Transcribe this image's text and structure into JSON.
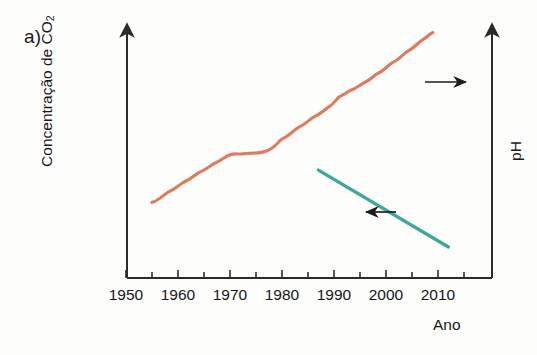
{
  "panel": {
    "label": "a)"
  },
  "axes": {
    "y_left_title_main": "Concentração de CO",
    "y_left_title_sub": "2",
    "y_right_title": "pH",
    "x_title": "Ano",
    "x_ticks": [
      "1950",
      "1960",
      "1970",
      "1980",
      "1990",
      "2000",
      "2010"
    ],
    "x_range": [
      1950,
      2014
    ],
    "x_minor_tick_step": 5,
    "grid": false,
    "left_axis_arrow": true,
    "right_axis_arrow": true
  },
  "annotations": [
    {
      "name": "arrow-to-right-axis",
      "direction": "right",
      "meaning": "CO2 curve reads on left axis pointing right"
    },
    {
      "name": "arrow-to-left-axis",
      "direction": "left",
      "meaning": "pH line reads on right axis pointing left"
    }
  ],
  "colors": {
    "co2_line": "#e07a5f",
    "ph_line": "#3fa89b",
    "axis": "#2b2b2b",
    "text": "#171717",
    "background": "#fdfdfc"
  },
  "chart_data": {
    "type": "line",
    "title": "",
    "xlabel": "Ano",
    "ylabel": "Concentração de CO2",
    "ylabel_right": "pH",
    "xlim": [
      1950,
      2014
    ],
    "grid": false,
    "legend": "none",
    "series": [
      {
        "name": "Concentração de CO2",
        "axis": "left",
        "color": "#e07a5f",
        "units": "relativo (eixo sem escala numérica)",
        "x": [
          1955,
          1958,
          1961,
          1964,
          1967,
          1970,
          1972,
          1974,
          1977,
          1980,
          1983,
          1986,
          1989,
          1991,
          1993,
          1996,
          1998,
          2001,
          2004,
          2007,
          2009
        ],
        "y_rel": [
          0.305,
          0.345,
          0.385,
          0.425,
          0.462,
          0.497,
          0.5,
          0.503,
          0.512,
          0.56,
          0.605,
          0.648,
          0.69,
          0.73,
          0.755,
          0.79,
          0.82,
          0.865,
          0.912,
          0.96,
          0.99
        ]
      },
      {
        "name": "pH",
        "axis": "right",
        "color": "#3fa89b",
        "units": "relativo (eixo sem escala numérica)",
        "x": [
          1987,
          2012
        ],
        "y_rel": [
          0.435,
          0.125
        ]
      }
    ]
  }
}
